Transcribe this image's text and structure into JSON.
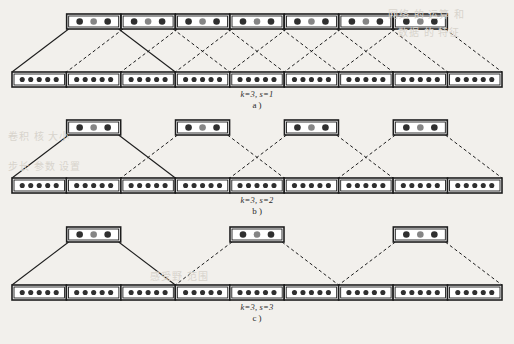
{
  "figure": {
    "background_color": "#f2f0ec",
    "ink_color": "#1d1d1d",
    "dot_dark_color": "#2f2f2f",
    "dot_gray_color": "#858585",
    "box_fill_color": "#ffffff",
    "solid_line_color": "#1d1d1d",
    "dashed_line_color": "#1d1d1d"
  },
  "panels": [
    {
      "id": "a",
      "letter_label": "a )",
      "formula_label": "k=3, s=1",
      "kernel_size": 3,
      "stride": 1,
      "top_boxes": 7,
      "bottom_boxes": 9,
      "top_box_dots": [
        "dark",
        "gray",
        "dark"
      ],
      "bottom_box_dots": [
        "dark",
        "dark",
        "dark",
        "dark",
        "dark"
      ],
      "highlighted_top_box_index": 0,
      "span_per_top_box": 3
    },
    {
      "id": "b",
      "letter_label": "b )",
      "formula_label": "k=3, s=2",
      "kernel_size": 3,
      "stride": 2,
      "top_boxes": 4,
      "bottom_boxes": 9,
      "top_box_dots": [
        "dark",
        "gray",
        "dark"
      ],
      "bottom_box_dots": [
        "dark",
        "dark",
        "dark",
        "dark",
        "dark"
      ],
      "highlighted_top_box_index": 0,
      "span_per_top_box": 3
    },
    {
      "id": "c",
      "letter_label": "c )",
      "formula_label": "k=3, s=3",
      "kernel_size": 3,
      "stride": 3,
      "top_boxes": 3,
      "bottom_boxes": 9,
      "top_box_dots": [
        "dark",
        "gray",
        "dark"
      ],
      "bottom_box_dots": [
        "dark",
        "dark",
        "dark",
        "dark",
        "dark"
      ],
      "highlighted_top_box_index": 0,
      "span_per_top_box": 3
    }
  ],
  "captions": {
    "a_formula": "k=3, s=1",
    "a_letter": "a )",
    "b_formula": "k=3, s=2",
    "b_letter": "b )",
    "c_formula": "k=3, s=3",
    "c_letter": "c )"
  },
  "background_bleed": {
    "note": "faint show-through text from reverse of scanned page",
    "lines": [
      "网络  的  运算 和",
      "数据  的  特征",
      "卷积  核  大小",
      "步长  参数  设置",
      "感受野  范围"
    ]
  }
}
